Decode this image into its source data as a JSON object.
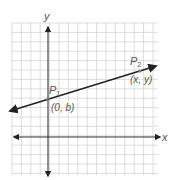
{
  "diagram": {
    "type": "coordinate-plane",
    "grid": {
      "x0": 12,
      "y0": 23,
      "x1": 158,
      "y1": 175,
      "cell": 9.4,
      "color": "#cfcfcf"
    },
    "axes": {
      "x_label": "x",
      "y_label": "y",
      "origin_px": [
        48,
        137
      ],
      "color": "#333333"
    },
    "line": {
      "from_px": [
        10,
        111
      ],
      "to_px": [
        156,
        66
      ],
      "color": "#222222"
    },
    "points": [
      {
        "name": "P",
        "sub": "1",
        "coords": "(0, b)",
        "px": [
          48,
          99
        ]
      },
      {
        "name": "P",
        "sub": "2",
        "coords": "(x, y)",
        "px": [
          140,
          71
        ]
      }
    ]
  }
}
